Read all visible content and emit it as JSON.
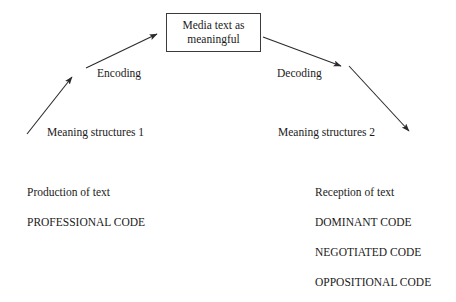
{
  "diagram": {
    "title_box": {
      "text": "Media text as\nmeaningful"
    },
    "flow_labels": {
      "encoding": "Encoding",
      "decoding": "Decoding",
      "meaning_structures_1": "Meaning structures 1",
      "meaning_structures_2": "Meaning structures 2"
    },
    "left_column": {
      "items": [
        "Production of text",
        "PROFESSIONAL CODE"
      ]
    },
    "right_column": {
      "items": [
        "Reception of text",
        "DOMINANT CODE",
        "NEGOTIATED CODE",
        "OPPOSITIONAL CODE"
      ]
    },
    "colors": {
      "background": "#ffffff",
      "text": "#1a1a1a",
      "stroke": "#2b2b2b",
      "box_border": "#3b3b3b"
    }
  }
}
